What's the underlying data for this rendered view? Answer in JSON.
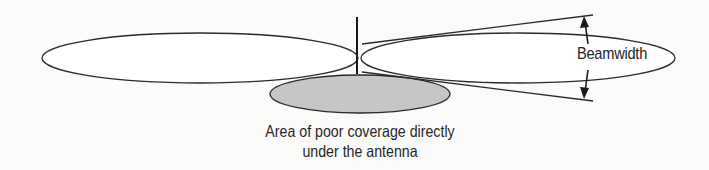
{
  "diagram": {
    "type": "antenna radiation pattern (omnidirectional, side view)",
    "labels": {
      "beamwidth": "Beamwidth",
      "caption_line1": "Area of poor coverage directly",
      "caption_line2": "under the antenna"
    },
    "elements": [
      {
        "name": "antenna-mast",
        "kind": "vertical line"
      },
      {
        "name": "left-lobe",
        "kind": "ellipse",
        "fill": "#ffffff"
      },
      {
        "name": "right-lobe",
        "kind": "ellipse",
        "fill": "#ffffff"
      },
      {
        "name": "poor-coverage-area",
        "kind": "ellipse",
        "fill": "#c8c8c8"
      },
      {
        "name": "beamwidth-upper-line",
        "kind": "line"
      },
      {
        "name": "beamwidth-lower-line",
        "kind": "line"
      },
      {
        "name": "beamwidth-arrows",
        "kind": "double arrow"
      }
    ],
    "colors": {
      "stroke": "#222222",
      "background": "#fbfbfa",
      "shaded_area": "#c8c8c8"
    }
  }
}
